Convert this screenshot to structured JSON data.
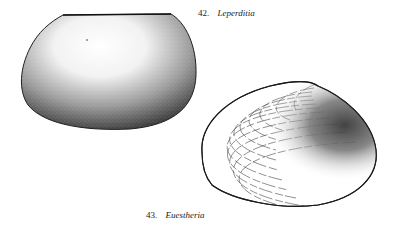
{
  "figures": [
    {
      "number": "42.",
      "name": "Leperditia",
      "style": "stippled shell, ovate-trapezoidal, straight hinge line at top"
    },
    {
      "number": "43.",
      "name": "Euestheria",
      "style": "growth-line shell with concentric rings, stippled umbo region on right"
    }
  ],
  "colors": {
    "ink": "#222222",
    "background": "#ffffff"
  }
}
